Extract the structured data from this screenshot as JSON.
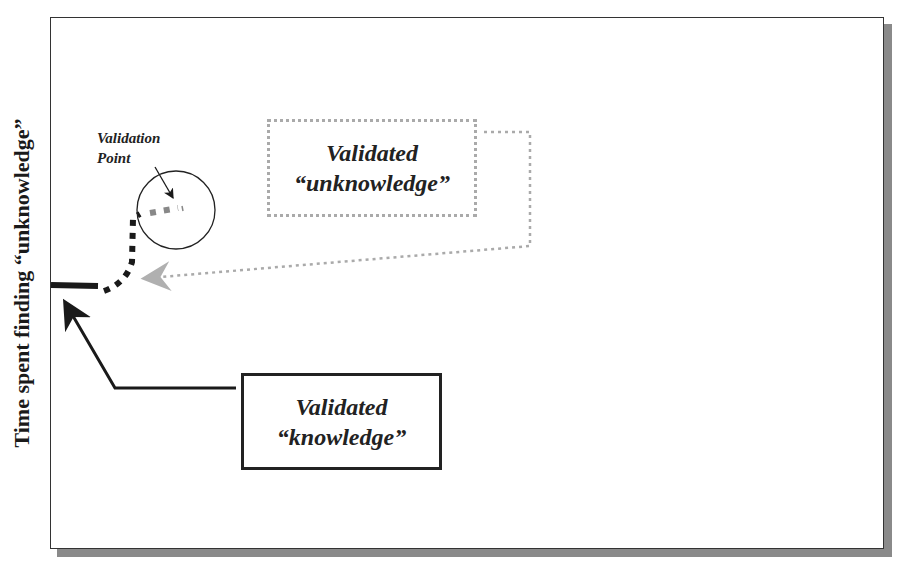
{
  "diagram": {
    "y_axis_label": "Time spent finding “unknowledge”",
    "x_axis_label_partial": "",
    "validation_point_label": [
      "Validation",
      "Point"
    ],
    "unknowledge_box": {
      "line1": "Validated",
      "line2": "“unknowledge”",
      "border_style": "dotted",
      "border_color": "#aaaaaa"
    },
    "knowledge_box": {
      "line1": "Validated",
      "line2": "“knowledge”",
      "border_style": "solid",
      "border_color": "#222222"
    },
    "colors": {
      "frame": "#333333",
      "shadow": "#8a8a8a",
      "path_dark": "#1a1a1a",
      "path_gray": "#888888",
      "connector": "#aaaaaa"
    }
  }
}
